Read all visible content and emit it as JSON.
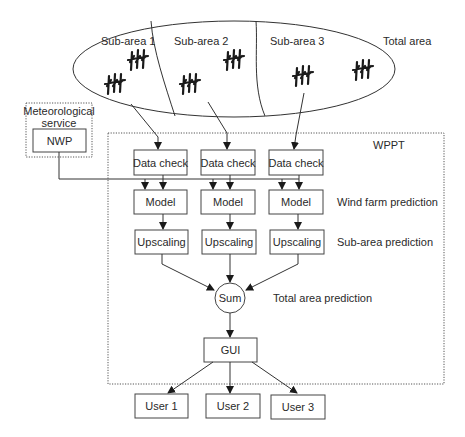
{
  "total_area": {
    "label": "Total area",
    "sub_areas": [
      {
        "label": "Sub-area 1",
        "turbine_groups": 2
      },
      {
        "label": "Sub-area 2",
        "turbine_groups": 2
      },
      {
        "label": "Sub-area 3",
        "turbine_groups": 2
      }
    ]
  },
  "meteorological_service": {
    "label_line1": "Meteorological",
    "label_line2": "service",
    "nwp_label": "NWP"
  },
  "wppt": {
    "label": "WPPT",
    "columns": [
      {
        "data_check": "Data check",
        "model": "Model",
        "upscaling": "Upscaling"
      },
      {
        "data_check": "Data check",
        "model": "Model",
        "upscaling": "Upscaling"
      },
      {
        "data_check": "Data check",
        "model": "Model",
        "upscaling": "Upscaling"
      }
    ],
    "stage_labels": {
      "wind_farm": "Wind farm prediction",
      "sub_area": "Sub-area prediction",
      "total_area": "Total area prediction"
    },
    "sum_label": "Sum",
    "gui_label": "GUI"
  },
  "users": [
    {
      "label": "User 1"
    },
    {
      "label": "User 2"
    },
    {
      "label": "User 3"
    }
  ]
}
